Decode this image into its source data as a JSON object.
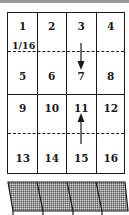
{
  "diagram": {
    "cells": [
      "1",
      "2",
      "3",
      "4",
      "5",
      "6",
      "7",
      "8",
      "9",
      "10",
      "11",
      "12",
      "13",
      "14",
      "15",
      "16"
    ],
    "fraction_label": "1/16",
    "arrows": [
      {
        "from_cell": "3",
        "to_cell": "7",
        "direction": "down"
      },
      {
        "from_cell": "15",
        "to_cell": "11",
        "direction": "up"
      }
    ],
    "fold_lines": [
      "between rows 1-2 (dashed)",
      "between rows 3-4 (dashed)"
    ],
    "hatched_strip": {
      "segments": 4,
      "pattern": "stippled-gray"
    }
  }
}
